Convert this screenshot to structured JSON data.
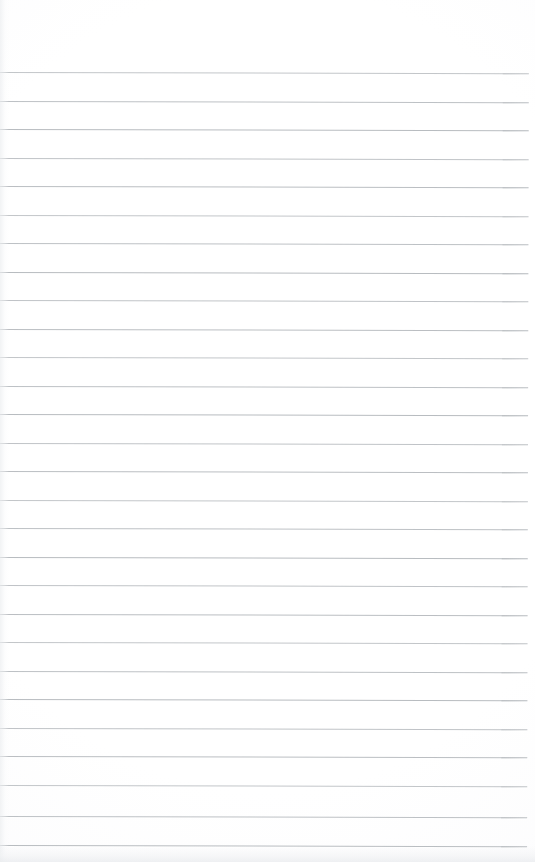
{
  "document": {
    "kind": "scanned-lined-paper",
    "page_width": 535,
    "page_height": 862,
    "background_color": "#ffffff",
    "paper_tone_color": "#fcfcfd",
    "has_visible_text": false,
    "has_handwriting": false,
    "has_header": false,
    "has_page_number": false,
    "has_margin_rule": false,
    "body_text": ""
  },
  "ruling": {
    "line_color": "#b6babe",
    "line_thickness_px": 1,
    "line_left_px": 0,
    "line_right_px": 529,
    "first_line_y_px": 72,
    "line_spacing_px": 28.6,
    "line_count": 28,
    "skew_degrees": 0.13,
    "lines": [
      {
        "index": 1,
        "y": 72,
        "left": 0,
        "width": 529
      },
      {
        "index": 2,
        "y": 101,
        "left": 0,
        "width": 529
      },
      {
        "index": 3,
        "y": 129,
        "left": 0,
        "width": 529
      },
      {
        "index": 4,
        "y": 158,
        "left": 0,
        "width": 529
      },
      {
        "index": 5,
        "y": 186,
        "left": 0,
        "width": 529
      },
      {
        "index": 6,
        "y": 215,
        "left": 0,
        "width": 529
      },
      {
        "index": 7,
        "y": 243,
        "left": 0,
        "width": 529
      },
      {
        "index": 8,
        "y": 272,
        "left": 0,
        "width": 529
      },
      {
        "index": 9,
        "y": 300,
        "left": 0,
        "width": 529
      },
      {
        "index": 10,
        "y": 329,
        "left": 0,
        "width": 529
      },
      {
        "index": 11,
        "y": 357,
        "left": 0,
        "width": 529
      },
      {
        "index": 12,
        "y": 386,
        "left": 0,
        "width": 529
      },
      {
        "index": 13,
        "y": 414,
        "left": 0,
        "width": 529
      },
      {
        "index": 14,
        "y": 443,
        "left": 0,
        "width": 529
      },
      {
        "index": 15,
        "y": 471,
        "left": 0,
        "width": 529
      },
      {
        "index": 16,
        "y": 500,
        "left": 0,
        "width": 529
      },
      {
        "index": 17,
        "y": 528,
        "left": 0,
        "width": 529
      },
      {
        "index": 18,
        "y": 557,
        "left": 0,
        "width": 529
      },
      {
        "index": 19,
        "y": 585,
        "left": 0,
        "width": 529
      },
      {
        "index": 20,
        "y": 614,
        "left": 0,
        "width": 529
      },
      {
        "index": 21,
        "y": 642,
        "left": 0,
        "width": 529
      },
      {
        "index": 22,
        "y": 671,
        "left": 0,
        "width": 529
      },
      {
        "index": 23,
        "y": 699,
        "left": 0,
        "width": 529
      },
      {
        "index": 24,
        "y": 728,
        "left": 0,
        "width": 529
      },
      {
        "index": 25,
        "y": 756,
        "left": 0,
        "width": 529
      },
      {
        "index": 26,
        "y": 785,
        "left": 0,
        "width": 529
      },
      {
        "index": 27,
        "y": 816,
        "left": 0,
        "width": 529
      },
      {
        "index": 28,
        "y": 845,
        "left": 0,
        "width": 529
      }
    ]
  },
  "margins": {
    "top_blank_height_px": 72,
    "bottom_noise_band_height_px": 16,
    "left_noise_band_width_px": 9,
    "right_blank_width_px": 6
  }
}
